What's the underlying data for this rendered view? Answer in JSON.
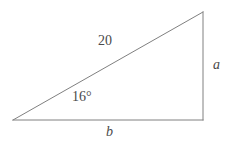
{
  "figure": {
    "type": "right-triangle-diagram",
    "background_color": "#ffffff",
    "stroke_color": "#808080",
    "text_color": "#4a4a4a",
    "stroke_width": 1
  },
  "geometry": {
    "vertices": {
      "left": {
        "x": 13,
        "y": 120
      },
      "bottom_right": {
        "x": 203,
        "y": 120
      },
      "top_right": {
        "x": 203,
        "y": 12
      }
    },
    "sides": {
      "hypotenuse": {
        "from": "left",
        "to": "top_right"
      },
      "vertical": {
        "from": "top_right",
        "to": "bottom_right"
      },
      "base": {
        "from": "bottom_right",
        "to": "left"
      }
    }
  },
  "labels": {
    "hypotenuse": "20",
    "angle": "16°",
    "side_vertical": "a",
    "side_base": "b"
  }
}
